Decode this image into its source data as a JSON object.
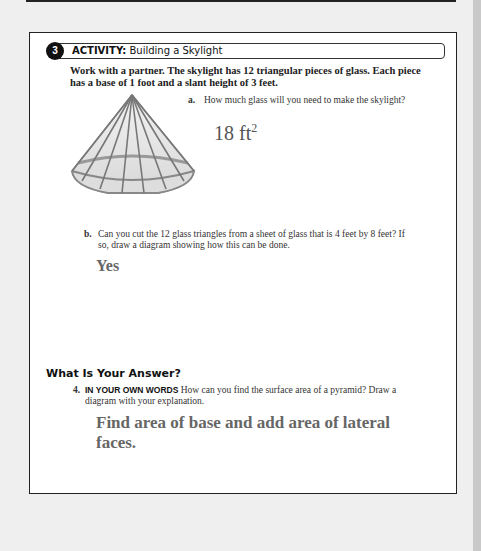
{
  "activity": {
    "number": "3",
    "label": "ACTIVITY:",
    "title": "Building a Skylight",
    "intro": "Work with a partner. The skylight has 12 triangular pieces of glass. Each piece has a base of 1 foot and a slant height of 3 feet."
  },
  "questions": {
    "a": {
      "label": "a.",
      "text": "How much glass will you need to make the skylight?",
      "answer_value": "18 ft",
      "answer_exponent": "2"
    },
    "b": {
      "label": "b.",
      "text": "Can you cut the 12 glass triangles from a sheet of glass that is 4 feet by 8 feet? If so, draw a diagram showing how this can be done.",
      "answer": "Yes"
    }
  },
  "answer_section": {
    "title": "What Is Your Answer?",
    "q4": {
      "number": "4.",
      "keyword": "IN YOUR OWN WORDS",
      "text": "How can you find the surface area of a pyramid? Draw a diagram with your explanation.",
      "answer": "Find area of base and add area of lateral faces."
    }
  },
  "figure": {
    "name": "skylight-pyramid",
    "faces": 12
  }
}
